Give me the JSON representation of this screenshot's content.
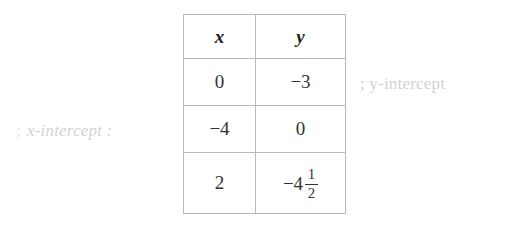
{
  "table": {
    "headers": [
      "x",
      "y"
    ],
    "rows": [
      {
        "x": "0",
        "y": "−3"
      },
      {
        "x": "−4",
        "y": "0"
      },
      {
        "x": "2",
        "y_whole": "−4",
        "y_numerator": "1",
        "y_denominator": "2"
      }
    ]
  },
  "annotations": {
    "y_intercept": ";  y-intercept",
    "x_intercept_lead": ";",
    "x_intercept": "x-intercept :"
  },
  "colors": {
    "background": "#ffffff",
    "table_border": "#b9b9b9",
    "text": "#333333",
    "annotation": "#d2d2d2"
  }
}
